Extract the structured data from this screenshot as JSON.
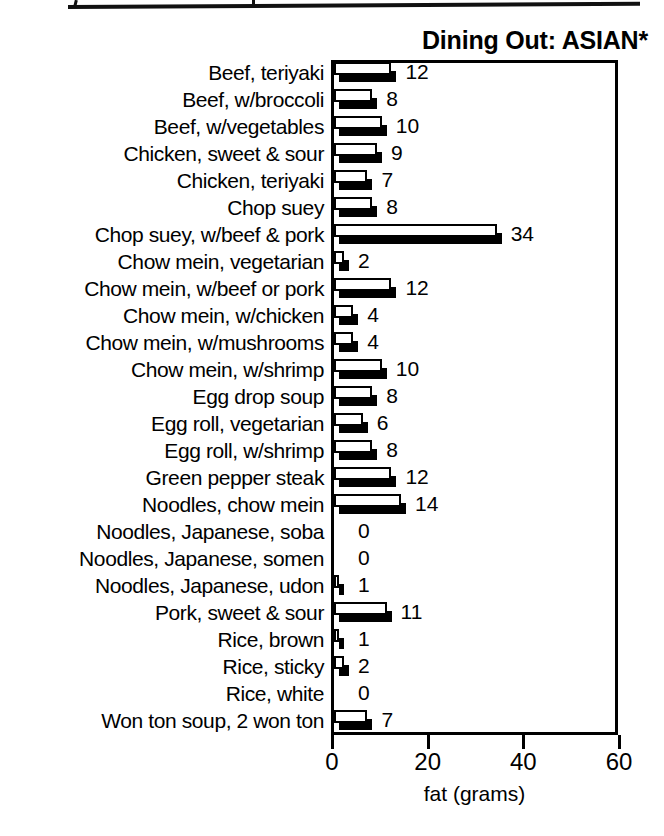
{
  "page": {
    "background": "#ffffff",
    "ink_color": "#000000"
  },
  "top_crop_line": {
    "name": "cropped-frame-remnant",
    "description": ""
  },
  "chart_data": {
    "type": "bar",
    "orientation": "horizontal",
    "title": "Dining Out: ASIAN*",
    "xlabel": "fat (grams)",
    "ylabel": "",
    "xlim": [
      0,
      60
    ],
    "xticks": [
      0,
      20,
      40,
      60
    ],
    "xtick_labels": [
      "0",
      "20",
      "40",
      "60"
    ],
    "grid": false,
    "legend": null,
    "value_labels_shown": true,
    "units": "grams of fat",
    "categories": [
      "Beef, teriyaki",
      "Beef, w/broccoli",
      "Beef, w/vegetables",
      "Chicken, sweet & sour",
      "Chicken, teriyaki",
      "Chop suey",
      "Chop suey, w/beef & pork",
      "Chow mein, vegetarian",
      "Chow mein, w/beef or pork",
      "Chow mein, w/chicken",
      "Chow mein, w/mushrooms",
      "Chow mein, w/shrimp",
      "Egg drop soup",
      "Egg roll, vegetarian",
      "Egg roll, w/shrimp",
      "Green pepper steak",
      "Noodles, chow mein",
      "Noodles, Japanese, soba",
      "Noodles, Japanese, somen",
      "Noodles, Japanese, udon",
      "Pork, sweet & sour",
      "Rice, brown",
      "Rice, sticky",
      "Rice, white",
      "Won ton soup, 2 won ton"
    ],
    "values": [
      12,
      8,
      10,
      9,
      7,
      8,
      34,
      2,
      12,
      4,
      4,
      10,
      8,
      6,
      8,
      12,
      14,
      0,
      0,
      1,
      11,
      1,
      2,
      0,
      7
    ],
    "value_label_texts": [
      "12",
      "8",
      "10",
      "9",
      "7",
      "8",
      "34",
      "2",
      "12",
      "4",
      "4",
      "10",
      "8",
      "6",
      "8",
      "12",
      "14",
      "0",
      "0",
      "1",
      "11",
      "1",
      "2",
      "0",
      "7"
    ]
  }
}
